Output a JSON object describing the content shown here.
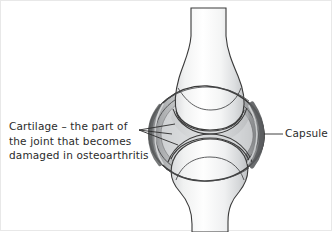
{
  "figure": {
    "type": "anatomical-illustration",
    "background_color": "#ffffff",
    "line_color": "#3a3a3a",
    "text_color": "#2b2b2b"
  },
  "labels": {
    "cartilage": {
      "name": "cartilage-label",
      "lines": [
        "Cartilage – the part of",
        "the joint that becomes",
        "damaged in osteoarthritis"
      ],
      "full_text": "Cartilage – the part of the joint that becomes damaged in osteoarthritis",
      "leader_lines": 2
    },
    "capsule": {
      "name": "capsule-label",
      "text": "Capsule",
      "leader_lines": 1
    }
  },
  "structures": [
    {
      "name": "upper-bone",
      "description": "upper long bone shaft widening to condyle"
    },
    {
      "name": "lower-bone",
      "description": "lower long bone head narrowing to shaft"
    },
    {
      "name": "joint-capsule",
      "description": "dark oval capsule enclosing the joint"
    },
    {
      "name": "upper-cartilage",
      "description": "cartilage layer on upper bone surface"
    },
    {
      "name": "lower-cartilage",
      "description": "cartilage layer on lower bone surface"
    },
    {
      "name": "joint-cavity",
      "description": "space between the two cartilage surfaces"
    }
  ],
  "colors": {
    "bone_light": "#fdfdfd",
    "bone_mid": "#e6e7e8",
    "bone_shadow": "#c9cbcc",
    "capsule_dark": "#6d6e70",
    "capsule_fill": "#b9bbbd",
    "outline": "#3a3a3a"
  }
}
